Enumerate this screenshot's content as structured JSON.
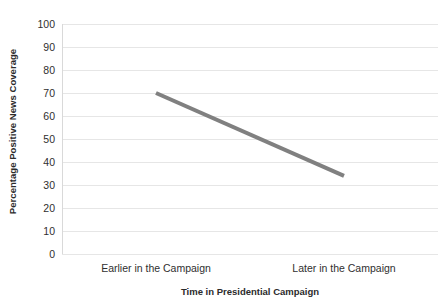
{
  "chart_data": {
    "type": "line",
    "title": "",
    "xlabel": "Time in Presidential Campaign",
    "ylabel": "Percentage Positive News Coverage",
    "categories": [
      "Earlier in the Campaign",
      "Later in the Campaign"
    ],
    "values": [
      70,
      34
    ],
    "series": [
      {
        "name": "Percentage Positive News Coverage",
        "values": [
          70,
          34
        ],
        "color": "#808080"
      }
    ],
    "ylim": [
      0,
      100
    ],
    "ytick_labels": [
      "100",
      "90",
      "80",
      "70",
      "60",
      "50",
      "40",
      "30",
      "20",
      "10",
      "0"
    ],
    "ytick_values": [
      100,
      90,
      80,
      70,
      60,
      50,
      40,
      30,
      20,
      10,
      0
    ],
    "grid": true,
    "grid_axis": "y",
    "grid_color": "#e6e6e6",
    "legend": "none",
    "legend_position": "none",
    "background": "#ffffff",
    "axis_color": "#d9d9d9",
    "text_color": "#2f2f2f"
  }
}
